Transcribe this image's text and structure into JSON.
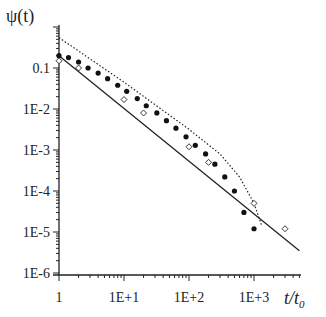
{
  "chart_data": {
    "type": "scatter",
    "title": "",
    "xlabel": "t/t0",
    "ylabel": "ψ(t)",
    "xscale": "log",
    "yscale": "log",
    "xlim": [
      1,
      5000
    ],
    "ylim": [
      1e-06,
      1
    ],
    "x_ticks": [
      "1",
      "1E+1",
      "1E+2",
      "1E+3"
    ],
    "y_ticks": [
      "0.1",
      "1E-2",
      "1E-3",
      "1E-4",
      "1E-5",
      "1E-6"
    ],
    "grid": false,
    "legend": null,
    "series": [
      {
        "name": "filled circles",
        "marker": "circle-filled",
        "x": [
          1,
          1.4,
          2,
          2.8,
          4,
          5.6,
          8,
          11,
          16,
          22,
          32,
          45,
          63,
          90,
          125,
          180,
          250,
          355,
          500,
          700,
          1000
        ],
        "y": [
          0.2,
          0.18,
          0.14,
          0.1,
          0.075,
          0.055,
          0.038,
          0.027,
          0.018,
          0.012,
          0.008,
          0.0052,
          0.0034,
          0.0021,
          0.0013,
          0.0008,
          0.00045,
          0.00022,
          0.0001,
          3e-05,
          1.2e-05
        ]
      },
      {
        "name": "open diamonds",
        "marker": "diamond-open",
        "x": [
          1,
          2,
          10,
          20,
          100,
          200,
          1000,
          3000
        ],
        "y": [
          0.15,
          0.1,
          0.017,
          0.008,
          0.0012,
          0.0005,
          5e-05,
          1.2e-05
        ]
      },
      {
        "name": "solid fit line",
        "style": "solid",
        "x": [
          1,
          5000
        ],
        "y": [
          0.2,
          3.5e-06
        ]
      },
      {
        "name": "dotted fit line",
        "style": "dotted",
        "x": [
          1,
          10,
          100,
          300,
          600,
          1000,
          1300
        ],
        "y": [
          0.55,
          0.045,
          0.0032,
          0.0008,
          0.00022,
          5e-05,
          1.5e-05
        ]
      }
    ]
  },
  "labels": {
    "y_axis_title": "ψ(t)",
    "x_axis_title_main": "t/t",
    "x_axis_title_sub": "0",
    "x_ticks": [
      "1",
      "1E+1",
      "1E+2",
      "1E+3"
    ],
    "y_ticks": [
      "0.1",
      "1E-2",
      "1E-3",
      "1E-4",
      "1E-5",
      "1E-6"
    ]
  }
}
